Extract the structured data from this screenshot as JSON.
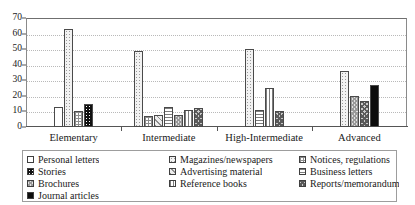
{
  "chart_data": {
    "type": "bar",
    "title": "",
    "xlabel": "",
    "ylabel": "",
    "ylim": [
      0,
      70
    ],
    "yticks": [
      0,
      10,
      20,
      30,
      40,
      50,
      60,
      70
    ],
    "grid": true,
    "legend_position": "bottom",
    "categories": [
      "Elementary",
      "Intermediate",
      "High-Intermediate",
      "Advanced"
    ],
    "series": [
      {
        "name": "Personal letters",
        "pattern": "p-white",
        "values": [
          13,
          0,
          0,
          0
        ]
      },
      {
        "name": "Magazines/newspapers",
        "pattern": "p-lightdot",
        "values": [
          63,
          49,
          50,
          36
        ]
      },
      {
        "name": "Notices, regulations",
        "pattern": "p-grid",
        "values": [
          10,
          7,
          0,
          0
        ]
      },
      {
        "name": "Stories",
        "pattern": "p-blackdot",
        "values": [
          15,
          0,
          0,
          0
        ]
      },
      {
        "name": "Advertising material",
        "pattern": "p-diag",
        "values": [
          0,
          8,
          0,
          0
        ]
      },
      {
        "name": "Business letters",
        "pattern": "p-hline",
        "values": [
          0,
          13,
          11,
          0
        ]
      },
      {
        "name": "Brochures",
        "pattern": "p-check",
        "values": [
          0,
          8,
          0,
          20
        ]
      },
      {
        "name": "Reference books",
        "pattern": "p-vline",
        "values": [
          0,
          11,
          25,
          0
        ]
      },
      {
        "name": "Reports/memorandums",
        "pattern": "p-darkcheck",
        "values": [
          0,
          12,
          10,
          17
        ]
      },
      {
        "name": "Journal articles",
        "pattern": "p-black",
        "values": [
          0,
          0,
          0,
          27
        ]
      }
    ]
  },
  "legend": {
    "columns": [
      [
        {
          "label": "Personal letters",
          "pattern": "p-white"
        },
        {
          "label": "Stories",
          "pattern": "p-blackdot"
        },
        {
          "label": "Brochures",
          "pattern": "p-check"
        },
        {
          "label": "Journal articles",
          "pattern": "p-black"
        }
      ],
      [
        {
          "label": "Magazines/newspapers",
          "pattern": "p-lightdot"
        },
        {
          "label": "Advertising material",
          "pattern": "p-diag"
        },
        {
          "label": "Reference books",
          "pattern": "p-vline"
        }
      ],
      [
        {
          "label": "Notices, regulations",
          "pattern": "p-grid"
        },
        {
          "label": "Business letters",
          "pattern": "p-hline"
        },
        {
          "label": "Reports/memorandums",
          "pattern": "p-darkcheck"
        }
      ]
    ]
  }
}
